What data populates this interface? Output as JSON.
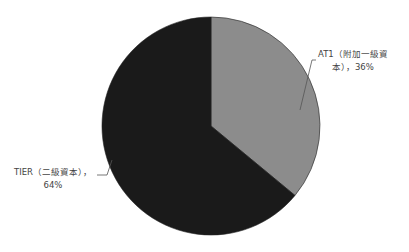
{
  "chart_data": {
    "type": "pie",
    "title": "",
    "categories": [
      "AT1（附加一級資本）",
      "TIER（二級資本）"
    ],
    "values": [
      36,
      64
    ],
    "unit": "%",
    "colors": [
      "#8c8c8c",
      "#1a1a1a"
    ],
    "legend": "none",
    "data_labels": true
  },
  "labels": {
    "at1_line1": "AT1（附加一級資",
    "at1_line2": "本），36%",
    "tier_line1": "TIER（二級資本），",
    "tier_line2": "64%"
  }
}
